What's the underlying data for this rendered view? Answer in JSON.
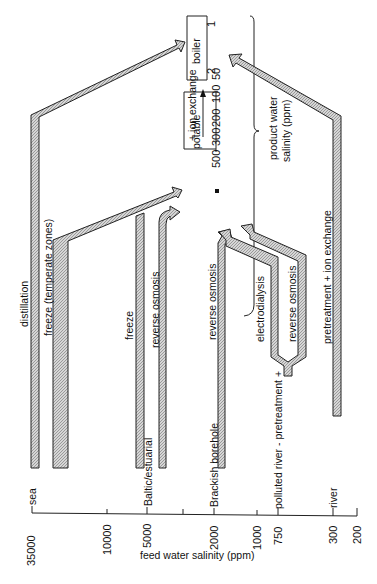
{
  "diagram": {
    "orientation": "rotated-90-ccw",
    "feed_axis": {
      "title": "feed water salinity (ppm)",
      "ticks": [
        {
          "value": "35000",
          "source": "sea"
        },
        {
          "value": "10000",
          "source": ""
        },
        {
          "value": "5000",
          "source": "Baltic/estuarial"
        },
        {
          "value": "2000",
          "source": "Brackish  borehole"
        },
        {
          "value": "1000",
          "source": ""
        },
        {
          "value": "750",
          "source": "polluted river - pretreatment +"
        },
        {
          "value": "300",
          "source": "river"
        },
        {
          "value": "200",
          "source": ""
        }
      ]
    },
    "product_axis": {
      "title_line1": "product water",
      "title_line2": "salinity (ppm)",
      "ticks": [
        "500",
        "300",
        "200",
        "100",
        "50",
        "2",
        "1"
      ],
      "ranges": [
        {
          "label": "potable"
        },
        {
          "label": "+ ion exchange"
        },
        {
          "label": "boiler"
        }
      ]
    },
    "processes": [
      {
        "label": "distillation",
        "from": "sea",
        "to": "boiler"
      },
      {
        "label": "freeze (temperate zones)",
        "from": "sea",
        "to": "potable"
      },
      {
        "label": "freeze",
        "from": "Baltic/estuarial",
        "to": "potable"
      },
      {
        "label": "reverse osmosis",
        "from": "Baltic/estuarial",
        "to": "potable"
      },
      {
        "label": "reverse osmosis",
        "from": "Brackish borehole",
        "to": "potable"
      },
      {
        "label": "electrodialysis",
        "from": "polluted river",
        "to": "potable"
      },
      {
        "label": "reverse osmosis",
        "from": "polluted river",
        "to": "potable"
      },
      {
        "label": "pretreatment + ion exchange",
        "from": "river",
        "to": "boiler"
      }
    ]
  }
}
